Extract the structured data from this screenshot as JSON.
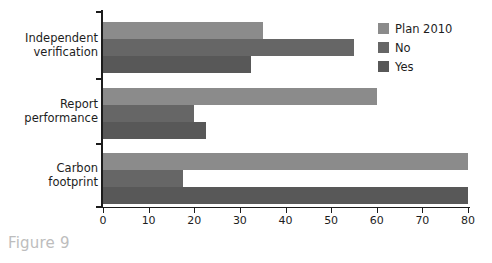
{
  "caption": "Figure 9",
  "legend": {
    "position": "top-right",
    "entries": [
      {
        "label": "Plan 2010",
        "color": "#8b8b8b",
        "swatch": "legend-swatch-plan-2010"
      },
      {
        "label": "No",
        "color": "#666666",
        "swatch": "legend-swatch-no"
      },
      {
        "label": "Yes",
        "color": "#585858",
        "swatch": "legend-swatch-yes"
      }
    ]
  },
  "axis": {
    "x_ticks": [
      "0",
      "10",
      "20",
      "30",
      "40",
      "50",
      "60",
      "70",
      "80"
    ],
    "x_tick_values": [
      0,
      10,
      20,
      30,
      40,
      50,
      60,
      70,
      80
    ],
    "y_categories": [
      {
        "line1": "Independent",
        "line2": "verification"
      },
      {
        "line1": "Report",
        "line2": "performance"
      },
      {
        "line1": "Carbon",
        "line2": "footprint"
      }
    ]
  },
  "chart_data": {
    "type": "bar",
    "orientation": "horizontal",
    "title": "",
    "subtitle": "",
    "xlabel": "",
    "ylabel": "",
    "xlim": [
      0,
      80
    ],
    "grid": false,
    "legend_position": "top-right",
    "categories": [
      "Independent verification",
      "Report performance",
      "Carbon footprint"
    ],
    "series": [
      {
        "name": "Plan 2010",
        "color": "#8b8b8b",
        "values": [
          35,
          60,
          80
        ]
      },
      {
        "name": "No",
        "color": "#666666",
        "values": [
          55,
          20,
          17.5
        ]
      },
      {
        "name": "Yes",
        "color": "#585858",
        "values": [
          32.5,
          22.5,
          80
        ]
      }
    ],
    "annotations": [
      "Figure 9"
    ]
  }
}
